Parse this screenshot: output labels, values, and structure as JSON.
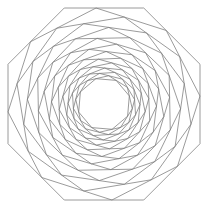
{
  "figure": {
    "type": "nested-polygon-spiral",
    "sides": 8,
    "center": [
      104,
      104
    ],
    "outer_apothem": 96,
    "layers": 19,
    "edge_fraction": 0.4,
    "stroke_color": "#7a7a7a",
    "stroke_width": 0.75,
    "background": "#ffffff"
  }
}
